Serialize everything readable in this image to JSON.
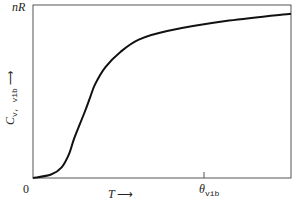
{
  "chart_data": {
    "type": "line",
    "title": "",
    "xlabel": "T",
    "ylabel": "C_v,vib",
    "y_top_label": "nR",
    "origin_label": "0",
    "x_tick_labels": [
      "θ_vib"
    ],
    "grid": false,
    "legend": null,
    "series": [
      {
        "name": "C_v,vib vs T",
        "x": [
          0,
          0.07,
          0.11,
          0.14,
          0.16,
          0.2,
          0.22,
          0.24,
          0.28,
          0.34,
          0.41,
          0.52,
          0.76,
          1.0
        ],
        "y": [
          0,
          0.02,
          0.06,
          0.14,
          0.23,
          0.38,
          0.46,
          0.54,
          0.64,
          0.73,
          0.8,
          0.85,
          0.91,
          0.95
        ]
      }
    ],
    "theta_vib_fraction": 0.66,
    "ylim": [
      0,
      1
    ],
    "xlim": [
      0,
      1
    ],
    "y_max_meaning": "nR asymptote"
  },
  "labels": {
    "nR": "nR",
    "origin": "0",
    "T": "T",
    "T_arrow": "⟶",
    "theta": "θ",
    "theta_sub": "vib",
    "Cv": "C",
    "Cv_sub": "v, vib",
    "Cv_arrow": "⟶"
  }
}
